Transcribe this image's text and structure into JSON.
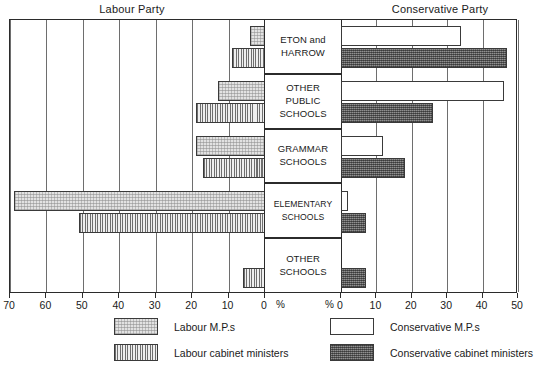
{
  "titles": {
    "labour": "Labour Party",
    "conservative": "Conservative Party"
  },
  "axis": {
    "left_ticks": [
      "70",
      "60",
      "50",
      "40",
      "30",
      "20",
      "10",
      "0"
    ],
    "right_ticks": [
      "0",
      "10",
      "20",
      "30",
      "40",
      "50"
    ],
    "percent_left": "%",
    "percent_right": "%"
  },
  "categories": [
    {
      "lines": [
        "ETON and",
        "HARROW"
      ]
    },
    {
      "lines": [
        "OTHER",
        "PUBLIC",
        "SCHOOLS"
      ]
    },
    {
      "lines": [
        "GRAMMAR",
        "SCHOOLS"
      ]
    },
    {
      "lines": [
        "ELEMENTARY",
        "SCHOOLS"
      ]
    },
    {
      "lines": [
        "OTHER",
        "SCHOOLS"
      ]
    }
  ],
  "legend": [
    {
      "key": "labour_mps",
      "label": "Labour M.P.s"
    },
    {
      "key": "labour_cabinet",
      "label": "Labour cabinet ministers"
    },
    {
      "key": "conservative_mps",
      "label": "Conservative M.P.s"
    },
    {
      "key": "conservative_cabinet",
      "label": "Conservative cabinet ministers"
    }
  ],
  "chart_data": {
    "type": "bar",
    "orientation": "horizontal-diverging",
    "xlabel": "%",
    "ylabel": "",
    "categories": [
      "ETON and HARROW",
      "OTHER PUBLIC SCHOOLS",
      "GRAMMAR SCHOOLS",
      "ELEMENTARY SCHOOLS",
      "OTHER SCHOOLS"
    ],
    "left_axis": {
      "label": "Labour Party",
      "ticks": [
        70,
        60,
        50,
        40,
        30,
        20,
        10,
        0
      ],
      "range": [
        70,
        0
      ],
      "direction": "right-to-left"
    },
    "right_axis": {
      "label": "Conservative Party",
      "ticks": [
        0,
        10,
        20,
        30,
        40,
        50
      ],
      "range": [
        0,
        50
      ],
      "direction": "left-to-right"
    },
    "grid": true,
    "legend_position": "bottom",
    "series": [
      {
        "name": "Labour M.P.s",
        "side": "left",
        "values": [
          4,
          13,
          19,
          69,
          0
        ]
      },
      {
        "name": "Labour cabinet ministers",
        "side": "left",
        "values": [
          9,
          19,
          17,
          51,
          6
        ]
      },
      {
        "name": "Conservative M.P.s",
        "side": "right",
        "values": [
          34,
          46,
          12,
          2,
          0
        ]
      },
      {
        "name": "Conservative cabinet ministers",
        "side": "right",
        "values": [
          47,
          26,
          18,
          7,
          7
        ]
      }
    ]
  }
}
